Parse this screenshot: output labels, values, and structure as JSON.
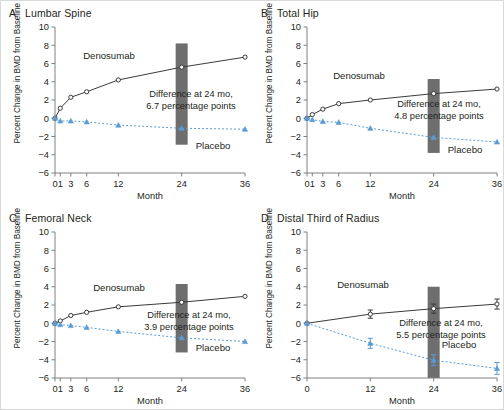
{
  "figure": {
    "y_axis_label": "Percent Change in BMD from Baseline",
    "x_axis_label": "Month",
    "series_names": {
      "treatment": "Denosumab",
      "control": "Placebo"
    },
    "colors": {
      "treatment_line": "#3b3b3b",
      "control_line": "#5b9bd5",
      "highlight_bar": "#6e6e6e",
      "axis": "#808080",
      "text": "#231f20"
    }
  },
  "chart_data": [
    {
      "type": "line",
      "panel": "A",
      "title": "Lumbar Spine",
      "xlabel": "Month",
      "ylabel": "Percent Change in BMD from Baseline",
      "xticks": [
        0,
        1,
        3,
        6,
        12,
        24,
        36
      ],
      "xticklabels": [
        "0",
        "1",
        "3",
        "6",
        "12",
        "24",
        "36"
      ],
      "yticks": [
        -6,
        -4,
        -2,
        0,
        2,
        4,
        6,
        8,
        10
      ],
      "yticklabels": [
        "−6",
        "−4",
        "−2",
        "0",
        "2",
        "4",
        "6",
        "8",
        "10"
      ],
      "ylim": [
        -6,
        10
      ],
      "xlim": [
        0,
        36
      ],
      "grid": false,
      "legend_position": "inline-annotation",
      "annotation": "Difference at 24 mo,\n6.7 percentage points",
      "annotation_line1": "Difference at 24 mo,",
      "annotation_line2": "6.7 percentage points",
      "difference_at_24mo": 6.7,
      "highlight_month": 24,
      "series": [
        {
          "name": "Denosumab",
          "x": [
            0,
            1,
            3,
            6,
            12,
            24,
            36
          ],
          "values": [
            0.0,
            1.1,
            2.3,
            2.9,
            4.2,
            5.6,
            6.7
          ]
        },
        {
          "name": "Placebo",
          "x": [
            0,
            1,
            3,
            6,
            12,
            24,
            36
          ],
          "values": [
            0.0,
            -0.3,
            -0.3,
            -0.4,
            -0.75,
            -1.1,
            -1.2
          ]
        }
      ]
    },
    {
      "type": "line",
      "panel": "B",
      "title": "Total Hip",
      "xlabel": "Month",
      "ylabel": "Percent Change in BMD from Baseline",
      "xticks": [
        0,
        1,
        3,
        6,
        12,
        24,
        36
      ],
      "xticklabels": [
        "0",
        "1",
        "3",
        "6",
        "12",
        "24",
        "36"
      ],
      "yticks": [
        -6,
        -4,
        -2,
        0,
        2,
        4,
        6,
        8,
        10
      ],
      "yticklabels": [
        "−6",
        "−4",
        "−2",
        "0",
        "2",
        "4",
        "6",
        "8",
        "10"
      ],
      "ylim": [
        -6,
        10
      ],
      "xlim": [
        0,
        36
      ],
      "grid": false,
      "legend_position": "inline-annotation",
      "annotation_line1": "Difference at 24 mo,",
      "annotation_line2": "4.8 percentage points",
      "difference_at_24mo": 4.8,
      "highlight_month": 24,
      "series": [
        {
          "name": "Denosumab",
          "x": [
            0,
            1,
            3,
            6,
            12,
            24,
            36
          ],
          "values": [
            0.0,
            0.4,
            1.0,
            1.6,
            2.0,
            2.7,
            3.2
          ]
        },
        {
          "name": "Placebo",
          "x": [
            0,
            1,
            3,
            6,
            12,
            24,
            36
          ],
          "values": [
            0.0,
            -0.15,
            -0.35,
            -0.45,
            -1.1,
            -2.1,
            -2.6
          ]
        }
      ]
    },
    {
      "type": "line",
      "panel": "C",
      "title": "Femoral Neck",
      "xlabel": "Month",
      "ylabel": "Percent Change in BMD from Baseline",
      "xticks": [
        0,
        1,
        3,
        6,
        12,
        24,
        36
      ],
      "xticklabels": [
        "0",
        "1",
        "3",
        "6",
        "12",
        "24",
        "36"
      ],
      "yticks": [
        -6,
        -4,
        -2,
        0,
        2,
        4,
        6,
        8,
        10
      ],
      "yticklabels": [
        "−6",
        "−4",
        "−2",
        "0",
        "2",
        "4",
        "6",
        "8",
        "10"
      ],
      "ylim": [
        -6,
        10
      ],
      "xlim": [
        0,
        36
      ],
      "grid": false,
      "legend_position": "inline-annotation",
      "annotation_line1": "Difference at 24 mo,",
      "annotation_line2": "3.9 percentage points",
      "difference_at_24mo": 3.9,
      "highlight_month": 24,
      "series": [
        {
          "name": "Denosumab",
          "x": [
            0,
            1,
            3,
            6,
            12,
            24,
            36
          ],
          "values": [
            0.0,
            0.25,
            0.85,
            1.2,
            1.8,
            2.3,
            2.95
          ]
        },
        {
          "name": "Placebo",
          "x": [
            0,
            1,
            3,
            6,
            12,
            24,
            36
          ],
          "values": [
            0.0,
            -0.15,
            -0.25,
            -0.45,
            -0.9,
            -1.6,
            -2.0
          ]
        }
      ]
    },
    {
      "type": "line",
      "panel": "D",
      "title": "Distal Third of Radius",
      "xlabel": "Month",
      "ylabel": "Percent Change in BMD from Baseline",
      "xticks": [
        0,
        12,
        24,
        36
      ],
      "xticklabels": [
        "0",
        "12",
        "24",
        "36"
      ],
      "yticks": [
        -6,
        -4,
        -2,
        0,
        2,
        4,
        6,
        8,
        10
      ],
      "yticklabels": [
        "−6",
        "−4",
        "−2",
        "0",
        "2",
        "4",
        "6",
        "8",
        "10"
      ],
      "ylim": [
        -6,
        10
      ],
      "xlim": [
        0,
        36
      ],
      "grid": false,
      "legend_position": "inline-annotation",
      "annotation_line1": "Difference at 24 mo,",
      "annotation_line2": "5.5 percentage points",
      "difference_at_24mo": 5.5,
      "highlight_month": 24,
      "series": [
        {
          "name": "Denosumab",
          "x": [
            0,
            12,
            24,
            36
          ],
          "values": [
            0.0,
            1.0,
            1.6,
            2.1
          ],
          "errors": [
            0.0,
            0.45,
            0.5,
            0.55
          ]
        },
        {
          "name": "Placebo",
          "x": [
            0,
            12,
            24,
            36
          ],
          "values": [
            0.0,
            -2.2,
            -4.05,
            -4.95
          ],
          "errors": [
            0.0,
            0.55,
            0.6,
            0.65
          ]
        }
      ]
    }
  ]
}
